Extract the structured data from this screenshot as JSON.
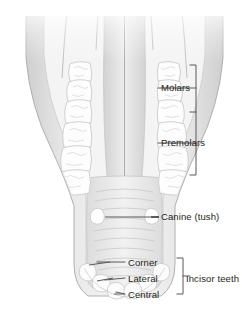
{
  "figure": {
    "width": 249,
    "height": 312,
    "background_color": "#ffffff",
    "label_color": "#231f20",
    "leader_line_color": "#58595b",
    "bracket_color": "#58595b"
  },
  "illustration": {
    "name": "horse-mandible-occlusal-view",
    "description": "Grayscale anatomical rendering of a horse lower jaw seen from above, showing two symmetric rows of cheek teeth, paired canine teeth, and an arch of incisors at the front",
    "colors": {
      "tissue_light": "#f2f2f2",
      "tissue_mid": "#d9d9d9",
      "tissue_shadow": "#b5b5b5",
      "tooth_white": "#fdfdfd",
      "tooth_outline": "#c9c9c9",
      "outline": "#a8a8a8"
    },
    "parts": [
      {
        "name": "left-cheek-teeth-row",
        "count": 6
      },
      {
        "name": "right-cheek-teeth-row",
        "count": 6
      },
      {
        "name": "left-canine-tooth",
        "count": 1
      },
      {
        "name": "right-canine-tooth",
        "count": 1
      },
      {
        "name": "incisor-arch",
        "count": 6
      }
    ]
  },
  "labels": {
    "molars": "Molars",
    "premolars": "Premolars",
    "canine": "Canine (tush)",
    "corner": "Corner",
    "lateral": "Lateral",
    "central": "Central",
    "incisor_teeth": "Incisor teeth"
  },
  "brackets": [
    {
      "name": "cheek-teeth-bracket",
      "groups": [
        "Molars",
        "Premolars"
      ],
      "orientation": "vertical-left-facing"
    },
    {
      "name": "incisor-teeth-bracket",
      "groups": [
        "Corner",
        "Lateral",
        "Central"
      ],
      "orientation": "vertical-left-facing"
    }
  ],
  "leader_lines": [
    {
      "name": "molars-leader",
      "target": "molar-region"
    },
    {
      "name": "premolars-leader",
      "target": "premolar-region"
    },
    {
      "name": "canine-leader",
      "target": "right-canine-tooth"
    },
    {
      "name": "corner-leader",
      "target": "corner-incisor"
    },
    {
      "name": "lateral-leader",
      "target": "lateral-incisor"
    },
    {
      "name": "central-leader",
      "target": "central-incisor"
    }
  ]
}
